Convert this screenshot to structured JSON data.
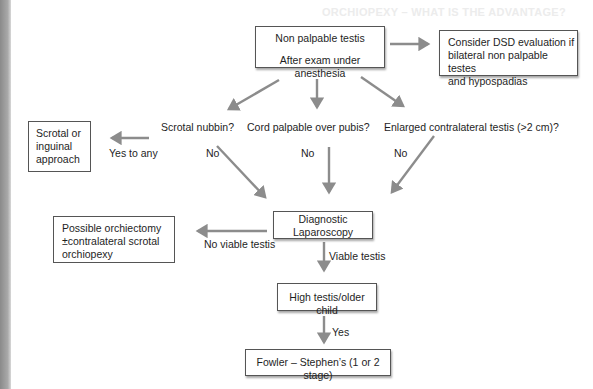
{
  "header_ghost": "ORCHIOPEXY – WHAT IS THE ADVANTAGE?",
  "nodes": {
    "start": {
      "line1": "Non palpable testis",
      "line2": "After exam under anesthesia"
    },
    "dsd": {
      "line1": "Consider DSD evaluation if",
      "line2": "bilateral non palpable testes",
      "line3": "and hypospadias"
    },
    "scrotal_approach": {
      "line1": "Scrotal or",
      "line2": "inguinal",
      "line3": "approach"
    },
    "laparoscopy": {
      "line1": "Diagnostic",
      "line2": "Laparoscopy"
    },
    "orchiectomy": {
      "line1": "Possible orchiectomy",
      "line2": "±contralateral scrotal",
      "line3": "orchiopexy"
    },
    "high_testis": {
      "line1": "High testis/older child"
    },
    "fowler": {
      "line1": "Fowler – Stephen’s (1 or 2 stage)"
    }
  },
  "questions": {
    "q1": "Scrotal nubbin?",
    "q2": "Cord palpable over pubis?",
    "q3": "Enlarged contralateral testis (>2 cm)?"
  },
  "edge_labels": {
    "yes_to_any": "Yes to any",
    "no1": "No",
    "no2": "No",
    "no3": "No",
    "no_viable": "No viable testis",
    "viable": "Viable testis",
    "yes": "Yes"
  },
  "colors": {
    "arrow": "#8c8c8c",
    "box_border": "#555555",
    "text": "#1e1e1e"
  }
}
